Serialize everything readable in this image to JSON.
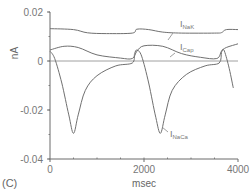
{
  "chart_data": {
    "type": "line",
    "panel_label": "(C)",
    "xlabel": "msec",
    "ylabel": "nA",
    "xlim": [
      0,
      4000
    ],
    "ylim": [
      -0.04,
      0.02
    ],
    "x_ticks": [
      0,
      2000,
      4000
    ],
    "x_tick_labels": [
      "0",
      "2000",
      "4000"
    ],
    "y_ticks": [
      0.02,
      0,
      -0.02,
      -0.04
    ],
    "y_tick_labels": [
      "0.02",
      "0",
      "-0.02",
      "-0.04"
    ],
    "zero_line": true,
    "grid": false,
    "series": [
      {
        "name": "I_NaK",
        "label_main": "I",
        "label_sub": "NaK",
        "x": [
          0,
          500,
          800,
          1200,
          1750,
          1850,
          2100,
          2400,
          2800,
          3500,
          3650,
          3750,
          4000
        ],
        "y": [
          0.0132,
          0.0128,
          0.0115,
          0.0112,
          0.0114,
          0.013,
          0.0128,
          0.0118,
          0.0114,
          0.0114,
          0.0116,
          0.0128,
          0.0128
        ]
      },
      {
        "name": "I_Cap",
        "label_main": "I",
        "label_sub": "Cap",
        "x": [
          0,
          300,
          600,
          1000,
          1500,
          1750,
          1850,
          2000,
          2400,
          2800,
          3200,
          3550,
          3650,
          3750,
          4000
        ],
        "y": [
          0.0045,
          0.006,
          0.0055,
          0.0025,
          0.0012,
          0.001,
          0.004,
          0.0062,
          0.006,
          0.003,
          0.0015,
          0.001,
          0.004,
          0.0055,
          0.007
        ]
      },
      {
        "name": "I_NaCa",
        "label_main": "I",
        "label_sub": "NaCa",
        "x": [
          0,
          100,
          250,
          400,
          500,
          600,
          750,
          1000,
          1400,
          1750,
          1800,
          1850,
          1950,
          2100,
          2250,
          2350,
          2450,
          2600,
          2900,
          3300,
          3600,
          3650,
          3700,
          3800,
          3900
        ],
        "y": [
          0.004,
          0.001,
          -0.009,
          -0.022,
          -0.0295,
          -0.022,
          -0.012,
          -0.006,
          -0.002,
          -0.0008,
          0.003,
          0.0045,
          0.002,
          -0.009,
          -0.023,
          -0.0295,
          -0.022,
          -0.012,
          -0.0055,
          -0.002,
          -0.0008,
          0.0035,
          0.0045,
          -0.002,
          -0.011
        ]
      }
    ]
  }
}
